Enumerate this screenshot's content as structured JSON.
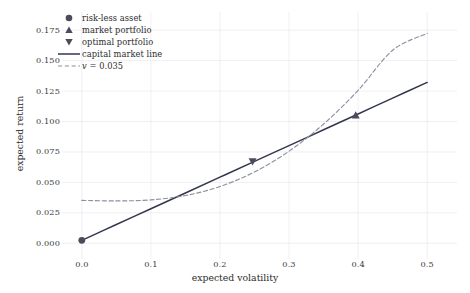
{
  "chart_data": {
    "type": "line",
    "title": "",
    "xlabel": "expected volatility",
    "ylabel": "expected return",
    "xlim": [
      -0.02,
      0.52
    ],
    "ylim": [
      -0.008,
      0.185
    ],
    "grid": true,
    "legend_position": "upper left",
    "xticks": [
      "0.0",
      "0.1",
      "0.2",
      "0.3",
      "0.4",
      "0.5"
    ],
    "xtick_values": [
      0.0,
      0.1,
      0.2,
      0.3,
      0.4,
      0.5
    ],
    "yticks": [
      "0.000",
      "0.025",
      "0.050",
      "0.075",
      "0.100",
      "0.125",
      "0.150",
      "0.175"
    ],
    "ytick_values": [
      0.0,
      0.025,
      0.05,
      0.075,
      0.1,
      0.125,
      0.15,
      0.175
    ],
    "series": [
      {
        "name": "capital market line",
        "type": "line",
        "style": "solid",
        "color": "#33374d",
        "x": [
          0.0,
          0.05,
          0.1,
          0.15,
          0.2,
          0.25,
          0.3,
          0.35,
          0.4,
          0.45,
          0.5
        ],
        "values": [
          0.0024,
          0.0154,
          0.0283,
          0.0413,
          0.0543,
          0.0673,
          0.0802,
          0.0932,
          0.1062,
          0.1192,
          0.1321
        ]
      },
      {
        "name": "v = 0.035",
        "type": "line",
        "style": "dashed",
        "color": "#8f8fa0",
        "x": [
          0.0,
          0.05,
          0.1,
          0.15,
          0.2,
          0.25,
          0.3,
          0.35,
          0.4,
          0.45,
          0.5
        ],
        "values": [
          0.0352,
          0.0348,
          0.0356,
          0.0392,
          0.0466,
          0.0586,
          0.0756,
          0.0979,
          0.1256,
          0.1585,
          0.1723
        ]
      }
    ],
    "points": [
      {
        "name": "risk-less asset",
        "marker": "circle",
        "color": "#4b4b5c",
        "x": 0.0,
        "y": 0.0024
      },
      {
        "name": "market portfolio",
        "marker": "triangle-up",
        "color": "#4b4b5c",
        "x": 0.3965,
        "y": 0.1052
      },
      {
        "name": "optimal portfolio",
        "marker": "triangle-down",
        "color": "#4b4b5c",
        "x": 0.2472,
        "y": 0.0671
      }
    ],
    "legend": [
      {
        "label": "risk-less asset",
        "marker": "circle"
      },
      {
        "label": "market portfolio",
        "marker": "triangle-up"
      },
      {
        "label": "optimal portfolio",
        "marker": "triangle-down"
      },
      {
        "label": "capital market line",
        "marker": "solid-line"
      },
      {
        "label": "v = 0.035",
        "marker": "dashed-line"
      }
    ],
    "colors": {
      "cml_line": "#33374d",
      "dashed_curve": "#8f8fa0",
      "marker": "#4b4b5c",
      "grid": "#eceaf0",
      "background": "#ffffff",
      "text": "#2e2e2e"
    }
  }
}
